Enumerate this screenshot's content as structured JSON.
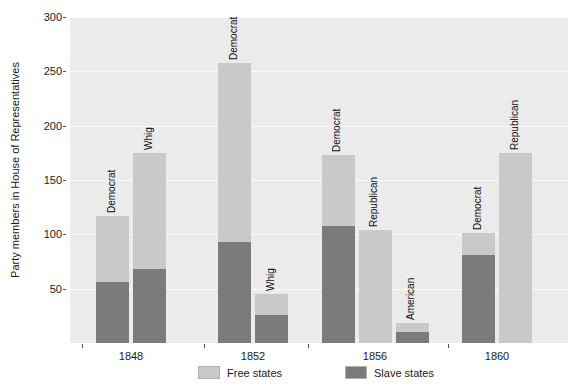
{
  "chart_data": {
    "type": "bar",
    "subtype": "stacked-grouped-bar",
    "title": "",
    "xlabel": "",
    "ylabel": "Party members in House of Representatives",
    "ylim": [
      0,
      300
    ],
    "yticks": [
      50,
      100,
      150,
      200,
      250,
      300
    ],
    "ytick_labels": [
      "50",
      "100",
      "150",
      "200",
      "250",
      "300"
    ],
    "categories": [
      "1848",
      "1852",
      "1856",
      "1860"
    ],
    "grid": "horizontal-white-on-gray",
    "legend_position": "bottom-center",
    "series": [
      {
        "name": "Free states",
        "color": "#c9c9c9"
      },
      {
        "name": "Slave states",
        "color": "#7b7b7b"
      }
    ],
    "groups": [
      {
        "year": "1848",
        "bars": [
          {
            "label": "Democrat",
            "free": 61,
            "slave": 56,
            "total": 117
          },
          {
            "label": "Whig",
            "free": 107,
            "slave": 68,
            "total": 175
          }
        ]
      },
      {
        "year": "1852",
        "bars": [
          {
            "label": "Democrat",
            "free": 165,
            "slave": 93,
            "total": 258
          },
          {
            "label": "Whig",
            "free": 19,
            "slave": 26,
            "total": 45
          }
        ]
      },
      {
        "year": "1856",
        "bars": [
          {
            "label": "Democrat",
            "free": 65,
            "slave": 108,
            "total": 173
          },
          {
            "label": "Republican",
            "free": 104,
            "slave": 0,
            "total": 104
          },
          {
            "label": "American",
            "free": 8,
            "slave": 10,
            "total": 18
          }
        ]
      },
      {
        "year": "1860",
        "bars": [
          {
            "label": "Democrat",
            "free": 20,
            "slave": 81,
            "total": 101
          },
          {
            "label": "Republican",
            "free": 175,
            "slave": 0,
            "total": 175
          }
        ]
      }
    ]
  },
  "legend": {
    "items": [
      {
        "label": "Free states",
        "color": "#c9c9c9"
      },
      {
        "label": "Slave states",
        "color": "#7b7b7b"
      }
    ]
  },
  "colors": {
    "panel_background": "#ebebeb",
    "gridline": "#fbfbfb",
    "free_states": "#c9c9c9",
    "slave_states": "#7b7b7b",
    "text": "#1a1a1a"
  }
}
